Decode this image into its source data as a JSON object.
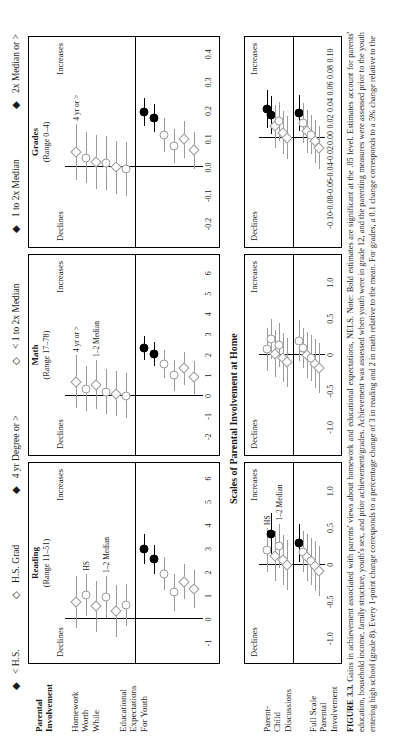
{
  "legend": [
    {
      "sym": "◆",
      "label": "< H.S."
    },
    {
      "sym": "◇",
      "label": "H.S. Grad"
    },
    {
      "sym": "◆",
      "label": "4 yr Degree or >"
    },
    {
      "sym": "◇",
      "label": "< 1 to 2x Median"
    },
    {
      "sym": "◆",
      "label": "1 to 2x Median"
    },
    {
      "sym": "◆",
      "label": "2x Median or >"
    }
  ],
  "sections": {
    "top_row_header_line1": "Parental",
    "top_row_header_line2": "Involvement",
    "home_scales_title": "Scales of Parental Involvement at Home"
  },
  "row_labels_top": [
    "Homework\nWorth\nWhile",
    "Educational\nExpectations\nFor Youth"
  ],
  "row_labels_bottom": [
    "Parent-\nChild\nDiscussions",
    "Full Scale\nParental\nInvolvement"
  ],
  "axis_words": {
    "declines": "Declines",
    "increases": "Increases"
  },
  "caption": {
    "label": "FIGURE 3.3.",
    "text": "  Gains in achievement associated with parents' views about homework and educational expectations, NELS. Note: Bold estimates are significant at the .05 level. Estimates account for parents' education, household income, family structure, youth's sex, and prior achievement/grades. Achievement was assessed when youth were in grade 12, and the parenting measures were assessed prior to the youth entering high school (grade 8). Every 1-point change corresponds to a percentage change of 3 in reading and 2 in math relative to the mean. For grades, a 0.1 change corresponds to a 5% change relative to the"
  },
  "chart_data": [
    {
      "id": "reading",
      "type": "scatter",
      "title": "Reading",
      "range_label": "(Range 11–51)",
      "xlabel": "",
      "xlim": [
        -1.6,
        6.4
      ],
      "ticks": [
        -1,
        0,
        1,
        2,
        3,
        4,
        5,
        6
      ],
      "left_word": "Declines",
      "right_word": "Increases",
      "groups": [
        {
          "name": "Homework Worth While",
          "points": [
            {
              "marker": "diamond",
              "style": "light",
              "x": 0.75,
              "lo": -0.35,
              "hi": 1.85,
              "label": ""
            },
            {
              "marker": "circle",
              "style": "light",
              "x": 1.05,
              "lo": 0.15,
              "hi": 1.95,
              "label": "HS"
            },
            {
              "marker": "diamond",
              "style": "light",
              "x": 0.55,
              "lo": -0.55,
              "hi": 1.65,
              "label": ""
            },
            {
              "marker": "circle",
              "style": "light",
              "x": 0.95,
              "lo": 0.05,
              "hi": 1.85,
              "label": "1–2 Median"
            },
            {
              "marker": "diamond",
              "style": "light",
              "x": 0.35,
              "lo": -0.75,
              "hi": 1.45,
              "label": ""
            },
            {
              "marker": "circle",
              "style": "light",
              "x": 0.6,
              "lo": -0.3,
              "hi": 1.5,
              "label": ""
            }
          ]
        },
        {
          "name": "Educational Expectations For Youth",
          "points": [
            {
              "marker": "circle",
              "style": "bold",
              "x": 3.0,
              "lo": 2.35,
              "hi": 3.65,
              "label": ""
            },
            {
              "marker": "circle",
              "style": "bold",
              "x": 2.55,
              "lo": 1.95,
              "hi": 3.15,
              "label": ""
            },
            {
              "marker": "circle",
              "style": "light",
              "x": 1.95,
              "lo": 1.25,
              "hi": 2.65,
              "label": ""
            },
            {
              "marker": "circle",
              "style": "light",
              "x": 1.15,
              "lo": 0.35,
              "hi": 1.95,
              "label": ""
            },
            {
              "marker": "diamond",
              "style": "light",
              "x": 1.6,
              "lo": 0.85,
              "hi": 2.35,
              "label": ""
            },
            {
              "marker": "diamond",
              "style": "light",
              "x": 1.3,
              "lo": 0.5,
              "hi": 2.1,
              "label": ""
            }
          ]
        }
      ]
    },
    {
      "id": "math",
      "type": "scatter",
      "title": "Math",
      "range_label": "(Range 17–78)",
      "xlabel": "",
      "xlim": [
        -2.6,
        6.6
      ],
      "ticks": [
        -2,
        -1,
        0,
        1,
        2,
        3,
        4,
        5,
        6
      ],
      "left_word": "Declines",
      "right_word": "Increases",
      "groups": [
        {
          "name": "Homework Worth While",
          "points": [
            {
              "marker": "diamond",
              "style": "light",
              "x": 0.7,
              "lo": -0.6,
              "hi": 2.0,
              "label": "4 yr or >"
            },
            {
              "marker": "circle",
              "style": "light",
              "x": 0.35,
              "lo": -0.75,
              "hi": 1.45,
              "label": ""
            },
            {
              "marker": "diamond",
              "style": "light",
              "x": 0.55,
              "lo": -0.65,
              "hi": 1.75,
              "label": "1–2 Median"
            },
            {
              "marker": "circle",
              "style": "light",
              "x": 0.2,
              "lo": -0.9,
              "hi": 1.3,
              "label": ""
            },
            {
              "marker": "diamond",
              "style": "light",
              "x": 0.1,
              "lo": -1.0,
              "hi": 1.2,
              "label": ""
            },
            {
              "marker": "circle",
              "style": "light",
              "x": 0.0,
              "lo": -1.1,
              "hi": 1.1,
              "label": ""
            }
          ]
        },
        {
          "name": "Educational Expectations For Youth",
          "points": [
            {
              "marker": "circle",
              "style": "bold",
              "x": 2.35,
              "lo": 1.75,
              "hi": 2.95,
              "label": ""
            },
            {
              "marker": "circle",
              "style": "bold",
              "x": 2.05,
              "lo": 1.45,
              "hi": 2.65,
              "label": ""
            },
            {
              "marker": "circle",
              "style": "light",
              "x": 1.55,
              "lo": 0.85,
              "hi": 2.25,
              "label": ""
            },
            {
              "marker": "circle",
              "style": "light",
              "x": 1.0,
              "lo": 0.25,
              "hi": 1.75,
              "label": ""
            },
            {
              "marker": "diamond",
              "style": "light",
              "x": 1.35,
              "lo": 0.55,
              "hi": 2.15,
              "label": ""
            },
            {
              "marker": "diamond",
              "style": "light",
              "x": 0.9,
              "lo": 0.1,
              "hi": 1.7,
              "label": ""
            }
          ]
        }
      ]
    },
    {
      "id": "grades",
      "type": "scatter",
      "title": "Grades",
      "range_label": "(Range 0–4)",
      "xlabel": "",
      "xlim": [
        -0.26,
        0.44
      ],
      "ticks": [
        -0.2,
        -0.1,
        0.0,
        0.1,
        0.2,
        0.3,
        0.4
      ],
      "left_word": "Declines",
      "right_word": "Increases",
      "groups": [
        {
          "name": "Homework Worth While",
          "points": [
            {
              "marker": "diamond",
              "style": "light",
              "x": 0.055,
              "lo": -0.045,
              "hi": 0.155,
              "label": "4 yr or >"
            },
            {
              "marker": "circle",
              "style": "light",
              "x": 0.035,
              "lo": -0.055,
              "hi": 0.125,
              "label": ""
            },
            {
              "marker": "diamond",
              "style": "light",
              "x": 0.02,
              "lo": -0.075,
              "hi": 0.115,
              "label": ""
            },
            {
              "marker": "circle",
              "style": "light",
              "x": 0.015,
              "lo": -0.08,
              "hi": 0.11,
              "label": ""
            },
            {
              "marker": "diamond",
              "style": "light",
              "x": 0.0,
              "lo": -0.095,
              "hi": 0.095,
              "label": ""
            },
            {
              "marker": "circle",
              "style": "light",
              "x": -0.005,
              "lo": -0.1,
              "hi": 0.09,
              "label": ""
            }
          ]
        },
        {
          "name": "Educational Expectations For Youth",
          "points": [
            {
              "marker": "circle",
              "style": "bold",
              "x": 0.195,
              "lo": 0.145,
              "hi": 0.245,
              "label": ""
            },
            {
              "marker": "circle",
              "style": "bold",
              "x": 0.175,
              "lo": 0.125,
              "hi": 0.225,
              "label": ""
            },
            {
              "marker": "circle",
              "style": "light",
              "x": 0.115,
              "lo": 0.055,
              "hi": 0.175,
              "label": ""
            },
            {
              "marker": "circle",
              "style": "light",
              "x": 0.075,
              "lo": 0.015,
              "hi": 0.135,
              "label": ""
            },
            {
              "marker": "diamond",
              "style": "light",
              "x": 0.1,
              "lo": 0.035,
              "hi": 0.165,
              "label": ""
            },
            {
              "marker": "diamond",
              "style": "light",
              "x": 0.06,
              "lo": -0.005,
              "hi": 0.125,
              "label": ""
            }
          ]
        }
      ]
    },
    {
      "id": "reading_home",
      "type": "scatter",
      "title": "",
      "range_label": "",
      "xlim": [
        -1.25,
        1.3
      ],
      "ticks": [
        -1.0,
        -0.5,
        0,
        0.5,
        1
      ],
      "left_word": "Declines",
      "right_word": "Increases",
      "groups": [
        {
          "name": "Parent-Child Discussions",
          "points": [
            {
              "marker": "circle",
              "style": "light",
              "x": 0.2,
              "lo": -0.1,
              "hi": 0.5,
              "label": "HS"
            },
            {
              "marker": "circle",
              "style": "bold",
              "x": 0.42,
              "lo": 0.14,
              "hi": 0.7,
              "label": ""
            },
            {
              "marker": "diamond",
              "style": "light",
              "x": 0.12,
              "lo": -0.22,
              "hi": 0.46,
              "label": ""
            },
            {
              "marker": "circle",
              "style": "light",
              "x": 0.26,
              "lo": -0.04,
              "hi": 0.56,
              "label": "1–2 Median"
            },
            {
              "marker": "diamond",
              "style": "light",
              "x": 0.06,
              "lo": -0.28,
              "hi": 0.4,
              "label": ""
            },
            {
              "marker": "diamond",
              "style": "light",
              "x": 0.0,
              "lo": -0.34,
              "hi": 0.34,
              "label": ""
            }
          ]
        },
        {
          "name": "Full Scale Parental Involvement",
          "points": [
            {
              "marker": "circle",
              "style": "bold",
              "x": 0.3,
              "lo": 0.04,
              "hi": 0.56,
              "label": ""
            },
            {
              "marker": "circle",
              "style": "light",
              "x": 0.18,
              "lo": -0.1,
              "hi": 0.46,
              "label": ""
            },
            {
              "marker": "diamond",
              "style": "light",
              "x": 0.1,
              "lo": -0.22,
              "hi": 0.42,
              "label": ""
            },
            {
              "marker": "circle",
              "style": "light",
              "x": 0.05,
              "lo": -0.27,
              "hi": 0.37,
              "label": ""
            },
            {
              "marker": "diamond",
              "style": "light",
              "x": -0.02,
              "lo": -0.36,
              "hi": 0.32,
              "label": ""
            },
            {
              "marker": "diamond",
              "style": "light",
              "x": -0.08,
              "lo": -0.42,
              "hi": 0.26,
              "label": ""
            }
          ]
        }
      ]
    },
    {
      "id": "math_home",
      "type": "scatter",
      "title": "",
      "range_label": "",
      "xlim": [
        -1.3,
        1.3
      ],
      "ticks": [
        -1.0,
        -0.5,
        0,
        0.5,
        1
      ],
      "left_word": "Declines",
      "right_word": "Increases",
      "groups": [
        {
          "name": "Parent-Child Discussions",
          "points": [
            {
              "marker": "circle",
              "style": "light",
              "x": 0.08,
              "lo": -0.22,
              "hi": 0.38,
              "label": ""
            },
            {
              "marker": "circle",
              "style": "light",
              "x": 0.22,
              "lo": -0.06,
              "hi": 0.5,
              "label": ""
            },
            {
              "marker": "diamond",
              "style": "light",
              "x": 0.02,
              "lo": -0.3,
              "hi": 0.34,
              "label": ""
            },
            {
              "marker": "circle",
              "style": "light",
              "x": 0.14,
              "lo": -0.16,
              "hi": 0.44,
              "label": ""
            },
            {
              "marker": "diamond",
              "style": "light",
              "x": -0.04,
              "lo": -0.38,
              "hi": 0.3,
              "label": ""
            },
            {
              "marker": "diamond",
              "style": "light",
              "x": -0.1,
              "lo": -0.44,
              "hi": 0.24,
              "label": ""
            }
          ]
        },
        {
          "name": "Full Scale Parental Involvement",
          "points": [
            {
              "marker": "circle",
              "style": "light",
              "x": 0.2,
              "lo": -0.08,
              "hi": 0.48,
              "label": ""
            },
            {
              "marker": "circle",
              "style": "light",
              "x": 0.1,
              "lo": -0.18,
              "hi": 0.38,
              "label": ""
            },
            {
              "marker": "diamond",
              "style": "light",
              "x": 0.0,
              "lo": -0.32,
              "hi": 0.32,
              "label": ""
            },
            {
              "marker": "circle",
              "style": "light",
              "x": -0.04,
              "lo": -0.36,
              "hi": 0.28,
              "label": ""
            },
            {
              "marker": "diamond",
              "style": "light",
              "x": -0.12,
              "lo": -0.46,
              "hi": 0.22,
              "label": ""
            },
            {
              "marker": "diamond",
              "style": "light",
              "x": -0.18,
              "lo": -0.52,
              "hi": 0.16,
              "label": ""
            }
          ]
        }
      ]
    },
    {
      "id": "grades_home",
      "type": "scatter",
      "title": "",
      "range_label": "",
      "xlim": [
        -0.125,
        0.115
      ],
      "ticks": [
        -0.1,
        -0.08,
        -0.06,
        -0.04,
        -0.02,
        0.0,
        0.02,
        0.04,
        0.06,
        0.08,
        0.1
      ],
      "left_word": "Declines",
      "right_word": "Increases",
      "groups": [
        {
          "name": "Parent-Child Discussions",
          "points": [
            {
              "marker": "circle",
              "style": "bold",
              "x": 0.035,
              "lo": 0.012,
              "hi": 0.058,
              "label": ""
            },
            {
              "marker": "circle",
              "style": "bold",
              "x": 0.028,
              "lo": 0.005,
              "hi": 0.051,
              "label": ""
            },
            {
              "marker": "diamond",
              "style": "light",
              "x": 0.014,
              "lo": -0.012,
              "hi": 0.04,
              "label": ""
            },
            {
              "marker": "circle",
              "style": "light",
              "x": 0.02,
              "lo": -0.004,
              "hi": 0.044,
              "label": ""
            },
            {
              "marker": "diamond",
              "style": "light",
              "x": 0.006,
              "lo": -0.02,
              "hi": 0.032,
              "label": ""
            },
            {
              "marker": "diamond",
              "style": "light",
              "x": 0.0,
              "lo": -0.026,
              "hi": 0.026,
              "label": ""
            }
          ]
        },
        {
          "name": "Full Scale Parental Involvement",
          "points": [
            {
              "marker": "circle",
              "style": "bold",
              "x": 0.03,
              "lo": 0.008,
              "hi": 0.052,
              "label": ""
            },
            {
              "marker": "circle",
              "style": "light",
              "x": 0.018,
              "lo": -0.006,
              "hi": 0.042,
              "label": ""
            },
            {
              "marker": "diamond",
              "style": "light",
              "x": 0.008,
              "lo": -0.018,
              "hi": 0.034,
              "label": ""
            },
            {
              "marker": "circle",
              "style": "light",
              "x": 0.004,
              "lo": -0.02,
              "hi": 0.028,
              "label": ""
            },
            {
              "marker": "diamond",
              "style": "light",
              "x": -0.004,
              "lo": -0.03,
              "hi": 0.022,
              "label": ""
            },
            {
              "marker": "diamond",
              "style": "light",
              "x": -0.012,
              "lo": -0.038,
              "hi": 0.014,
              "label": ""
            }
          ]
        }
      ]
    }
  ]
}
